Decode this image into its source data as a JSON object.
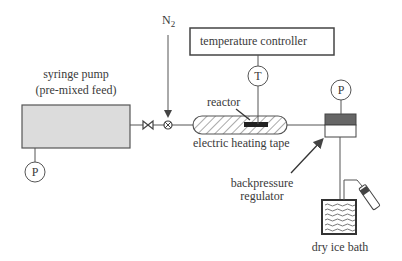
{
  "diagram": {
    "type": "process-flow-schematic",
    "components": {
      "syringe_pump": {
        "label_line1": "syringe pump",
        "label_line2": "(pre-mixed feed)"
      },
      "pump_gauge": {
        "symbol": "P"
      },
      "shutoff_valve": {
        "icon": "bowtie-valve"
      },
      "mixing_tee": {
        "icon": "circle-x-junction"
      },
      "nitrogen_inlet": {
        "label": "N",
        "subscript": "2"
      },
      "temperature_controller": {
        "label": "temperature controller"
      },
      "thermocouple": {
        "symbol": "T"
      },
      "reactor": {
        "label": "reactor"
      },
      "heating_tape": {
        "label": "electric heating tape"
      },
      "regulator_gauge": {
        "symbol": "P"
      },
      "backpressure_regulator": {
        "label_line1": "backpressure",
        "label_line2": "regulator"
      },
      "dry_ice_bath": {
        "label": "dry ice bath"
      },
      "collection_vial": {
        "icon": "vial"
      }
    },
    "colors": {
      "line": "#555555",
      "pump_fill": "#dcdcdc",
      "regulator_top_fill": "#666666",
      "text": "#3a3a3a"
    }
  }
}
